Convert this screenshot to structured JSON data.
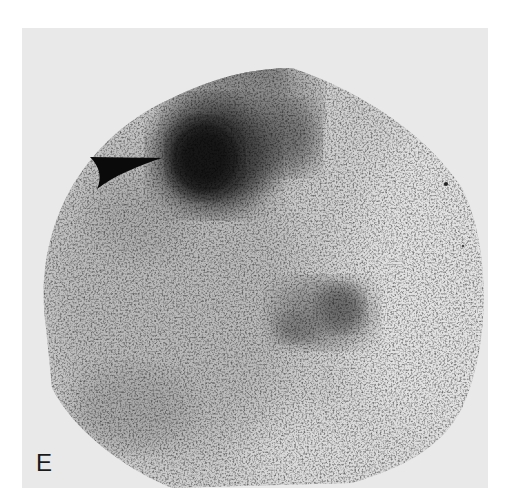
{
  "figure": {
    "panel_label": "E",
    "modality_appearance": "grayscale scintigraphy (gamma camera) image",
    "annotation": {
      "type": "arrowhead",
      "direction": "right",
      "points_to": "dense focal uptake, upper center-left"
    },
    "colors": {
      "page_background": "#ffffff",
      "frame_background": "#e9e9e9",
      "field_of_view_base": "#c9c9c9",
      "hot_spot": "#0d0d0d",
      "arrowhead": "#0a0a0a",
      "label_text": "#1a1a1a"
    }
  }
}
